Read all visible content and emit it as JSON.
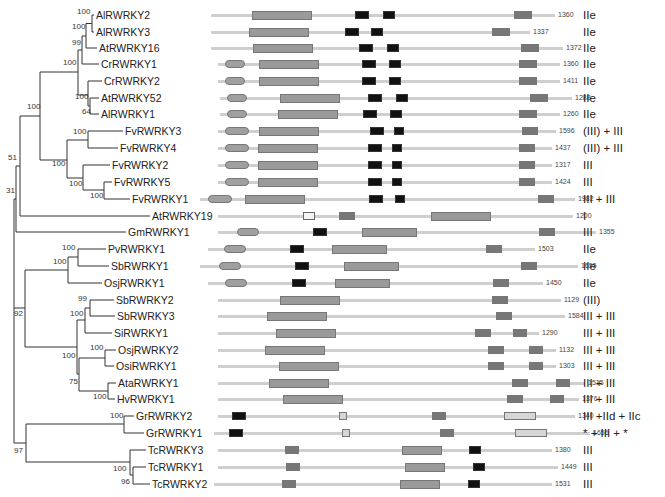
{
  "figure": {
    "type": "phylogenetic-tree-with-domain-architecture",
    "taxa": [
      {
        "name": "AlRWRKY2",
        "y": 15,
        "length": "1360",
        "class": "IIe"
      },
      {
        "name": "AlRWRKY3",
        "y": 32,
        "length": "1337",
        "class": "IIe"
      },
      {
        "name": "AtRWRKY16",
        "y": 48,
        "length": "1372",
        "class": "IIe"
      },
      {
        "name": "CrRWRKY1",
        "y": 64,
        "length": "1360",
        "class": "IIe"
      },
      {
        "name": "CrRWRKY2",
        "y": 81,
        "length": "1411",
        "class": "IIe"
      },
      {
        "name": "AtRWRKY52",
        "y": 98,
        "length": "1288",
        "class": "IIe"
      },
      {
        "name": "AlRWRKY1",
        "y": 114,
        "length": "1260",
        "class": "IIe"
      },
      {
        "name": "FvRWRKY3",
        "y": 131,
        "length": "1596",
        "class": "(III) + III"
      },
      {
        "name": "FvRWRKY4",
        "y": 148,
        "length": "1437",
        "class": "(III) + III"
      },
      {
        "name": "FvRWRKY2",
        "y": 165,
        "length": "1317",
        "class": "III"
      },
      {
        "name": "FvRWRKY5",
        "y": 182,
        "length": "1424",
        "class": "III"
      },
      {
        "name": "FvRWRKY1",
        "y": 199,
        "length": "1982",
        "class": "III + III"
      },
      {
        "name": "AtRWRKY19",
        "y": 216,
        "length": "1200",
        "class": "I"
      },
      {
        "name": "GmRWRKY1",
        "y": 232,
        "length": "1355",
        "class": "III"
      },
      {
        "name": "PvRWRKY1",
        "y": 249,
        "length": "1503",
        "class": "IIe"
      },
      {
        "name": "SbRWRKY1",
        "y": 266,
        "length": "1655",
        "class": "IIe"
      },
      {
        "name": "OsjRWRKY1",
        "y": 283,
        "length": "1450",
        "class": "IIe"
      },
      {
        "name": "SbRWRKY2",
        "y": 300,
        "length": "1129",
        "class": "(III)"
      },
      {
        "name": "SbRWRKY3",
        "y": 316,
        "length": "1584",
        "class": "III + III"
      },
      {
        "name": "SiRWRKY1",
        "y": 333,
        "length": "1290",
        "class": "III + III"
      },
      {
        "name": "OsjRWRKY2",
        "y": 350,
        "length": "1132",
        "class": "III + III"
      },
      {
        "name": "OsiRWRKY1",
        "y": 366,
        "length": "1303",
        "class": "III + III"
      },
      {
        "name": "AtaRWRKY1",
        "y": 383,
        "length": "1515",
        "class": "III + III"
      },
      {
        "name": "HvRWRKY1",
        "y": 399,
        "length": "1376",
        "class": "III + III"
      },
      {
        "name": "GrRWRKY2",
        "y": 416,
        "length": "1340",
        "class": "III +IId + IIc"
      },
      {
        "name": "GrRWRKY1",
        "y": 433,
        "length": "1656",
        "class": "* + III + *"
      },
      {
        "name": "TcRWRKY3",
        "y": 450,
        "length": "1380",
        "class": "III"
      },
      {
        "name": "TcRWRKY1",
        "y": 467,
        "length": "1449",
        "class": "III"
      },
      {
        "name": "TcRWRKY2",
        "y": 484,
        "length": "1531",
        "class": "III"
      }
    ],
    "bootstrap": [
      {
        "v": "100",
        "x": 77,
        "y": 11
      },
      {
        "v": "100",
        "x": 72,
        "y": 26
      },
      {
        "v": "99",
        "x": 72,
        "y": 42
      },
      {
        "v": "100",
        "x": 63,
        "y": 62
      },
      {
        "v": "100",
        "x": 75,
        "y": 96
      },
      {
        "v": "64",
        "x": 82,
        "y": 111
      },
      {
        "v": "100",
        "x": 27,
        "y": 106
      },
      {
        "v": "100",
        "x": 73,
        "y": 131
      },
      {
        "v": "100",
        "x": 52,
        "y": 163
      },
      {
        "v": "100",
        "x": 69,
        "y": 183
      },
      {
        "v": "100",
        "x": 90,
        "y": 195
      },
      {
        "v": "51",
        "x": 8,
        "y": 157
      },
      {
        "v": "31",
        "x": 6,
        "y": 190
      },
      {
        "v": "100",
        "x": 62,
        "y": 247
      },
      {
        "v": "100",
        "x": 53,
        "y": 261
      },
      {
        "v": "99",
        "x": 78,
        "y": 298
      },
      {
        "v": "100",
        "x": 70,
        "y": 313
      },
      {
        "v": "92",
        "x": 14,
        "y": 313
      },
      {
        "v": "100",
        "x": 90,
        "y": 347
      },
      {
        "v": "100",
        "x": 62,
        "y": 355
      },
      {
        "v": "75",
        "x": 69,
        "y": 381
      },
      {
        "v": "100",
        "x": 93,
        "y": 396
      },
      {
        "v": "100",
        "x": 110,
        "y": 415
      },
      {
        "v": "97",
        "x": 14,
        "y": 450
      },
      {
        "v": "100",
        "x": 113,
        "y": 468
      },
      {
        "v": "96",
        "x": 121,
        "y": 481
      }
    ],
    "domain_labels": [
      "NB-ARC",
      "TIR",
      "WRKY",
      "LRR",
      "PAH",
      "Calmodulin-bind"
    ]
  }
}
